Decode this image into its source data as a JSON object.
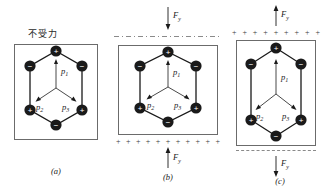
{
  "figure": {
    "title_cn": "不受力",
    "panels": [
      {
        "id": "a",
        "caption": "(a)",
        "state": "no force applied",
        "force_label": null,
        "has_charge_row": false,
        "dipoles": [
          "p1",
          "p2",
          "p3"
        ]
      },
      {
        "id": "b",
        "caption": "(b)",
        "state": "compressed",
        "force_label": "F",
        "force_subscript": "y",
        "force_top_direction": "down",
        "force_bottom_direction": "up",
        "has_charge_row": true,
        "charge_row_position": "bottom",
        "charge_row_count": 11,
        "charge_sign": "+",
        "dipoles": [
          "p1",
          "p2",
          "p3"
        ]
      },
      {
        "id": "c",
        "caption": "(c)",
        "state": "stretched",
        "force_label": "F",
        "force_subscript": "y",
        "force_top_direction": "up",
        "force_bottom_direction": "down",
        "has_charge_row": true,
        "charge_row_position": "top",
        "charge_row_count": 9,
        "charge_sign": "+",
        "dipoles": [
          "p1",
          "p2",
          "p3"
        ]
      }
    ],
    "lattice": {
      "vertices": [
        {
          "position": "top",
          "charge": "+"
        },
        {
          "position": "upper-right",
          "charge": "−"
        },
        {
          "position": "lower-right",
          "charge": "+"
        },
        {
          "position": "bottom",
          "charge": "−"
        },
        {
          "position": "lower-left",
          "charge": "+"
        },
        {
          "position": "upper-left",
          "charge": "−"
        }
      ],
      "ion_fill": "#1a1a1a",
      "ion_symbol_color": "#ffffff",
      "bond_color": "#1a1a1a"
    },
    "dipole_labels": {
      "p1": {
        "base": "p",
        "sub": "1"
      },
      "p2": {
        "base": "p",
        "sub": "2"
      },
      "p3": {
        "base": "p",
        "sub": "3"
      }
    },
    "colors": {
      "frame": "#6b6b6b",
      "line": "#1a1a1a",
      "dash": "#8a8a8a",
      "charge": "#3a3a3a",
      "background": "#ffffff"
    }
  }
}
